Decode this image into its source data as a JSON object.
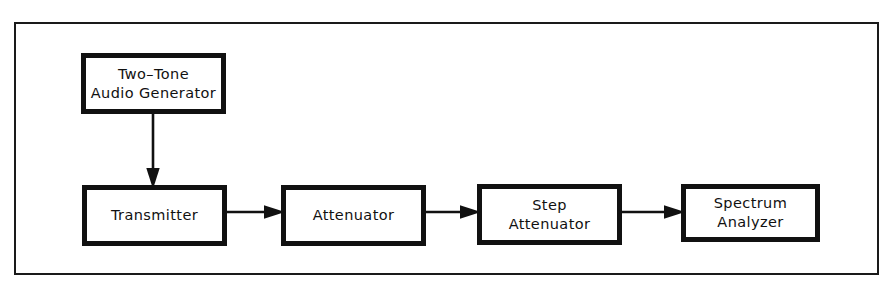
{
  "diagram": {
    "background_color": "#ffffff",
    "line_color": "#111111",
    "frame_color": "#1a1a1a",
    "blocks": [
      {
        "id": "two-tone-audio-generator",
        "label": "Two–Tone\nAudio Generator"
      },
      {
        "id": "transmitter",
        "label": "Transmitter"
      },
      {
        "id": "attenuator",
        "label": "Attenuator"
      },
      {
        "id": "step-attenuator",
        "label": "Step\nAttenuator"
      },
      {
        "id": "spectrum-analyzer",
        "label": "Spectrum\nAnalyzer"
      }
    ],
    "connections": [
      {
        "id": "gen-to-transmitter",
        "from": "two-tone-audio-generator",
        "to": "transmitter",
        "direction": "down"
      },
      {
        "id": "transmitter-to-atten",
        "from": "transmitter",
        "to": "attenuator",
        "direction": "right"
      },
      {
        "id": "atten-to-step",
        "from": "attenuator",
        "to": "step-attenuator",
        "direction": "right"
      },
      {
        "id": "step-to-analyzer",
        "from": "step-attenuator",
        "to": "spectrum-analyzer",
        "direction": "right"
      }
    ]
  }
}
